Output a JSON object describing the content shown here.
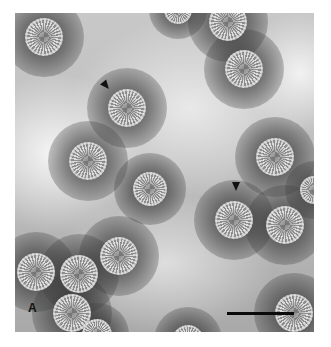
{
  "figure": {
    "type": "negative-stain electron micrograph",
    "panel_label": "A",
    "scale_bar": {
      "visible": true,
      "label": ""
    },
    "arrowheads": [
      {
        "id": "arrowhead-1",
        "x": 105,
        "y": 86,
        "direction": "down-right"
      },
      {
        "id": "arrowhead-2",
        "x": 236,
        "y": 187,
        "direction": "down"
      }
    ],
    "particles": [
      {
        "cx": 44,
        "cy": 37,
        "r": 19
      },
      {
        "cx": 228,
        "cy": 22,
        "r": 19
      },
      {
        "cx": 178,
        "cy": 10,
        "r": 14
      },
      {
        "cx": 244,
        "cy": 69,
        "r": 19
      },
      {
        "cx": 127,
        "cy": 108,
        "r": 19
      },
      {
        "cx": 88,
        "cy": 161,
        "r": 19
      },
      {
        "cx": 150,
        "cy": 189,
        "r": 17
      },
      {
        "cx": 275,
        "cy": 157,
        "r": 19
      },
      {
        "cx": 314,
        "cy": 190,
        "r": 14
      },
      {
        "cx": 234,
        "cy": 220,
        "r": 19
      },
      {
        "cx": 285,
        "cy": 225,
        "r": 19
      },
      {
        "cx": 119,
        "cy": 256,
        "r": 19
      },
      {
        "cx": 36,
        "cy": 272,
        "r": 19
      },
      {
        "cx": 79,
        "cy": 274,
        "r": 19
      },
      {
        "cx": 72,
        "cy": 313,
        "r": 19
      },
      {
        "cx": 97,
        "cy": 334,
        "r": 15
      },
      {
        "cx": 188,
        "cy": 341,
        "r": 16
      },
      {
        "cx": 294,
        "cy": 313,
        "r": 19
      }
    ]
  }
}
